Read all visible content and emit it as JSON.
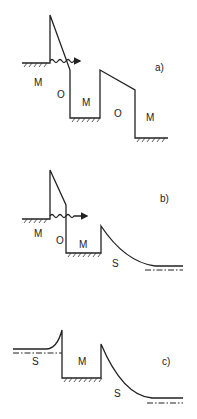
{
  "figure": {
    "panels": [
      {
        "id": "a",
        "label": "a)",
        "regions": [
          "M",
          "O",
          "M",
          "O",
          "M"
        ]
      },
      {
        "id": "b",
        "label": "b)",
        "regions": [
          "M",
          "O",
          "M",
          "S"
        ]
      },
      {
        "id": "c",
        "label": "c)",
        "regions": [
          "S",
          "M",
          "S"
        ]
      }
    ],
    "colors": {
      "line": "#222222",
      "background": "#ffffff"
    }
  }
}
